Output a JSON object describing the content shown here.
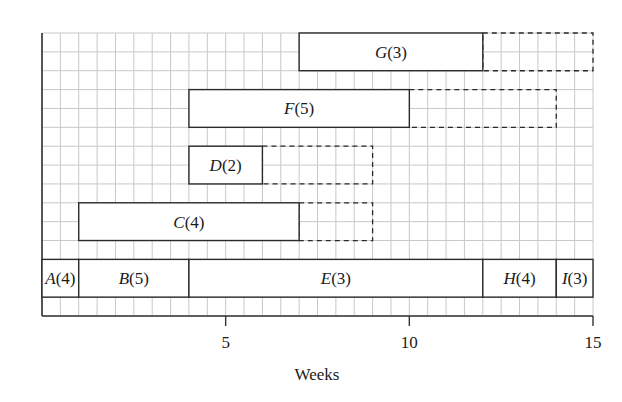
{
  "chart_data": {
    "type": "gantt",
    "title": "",
    "xlabel": "Weeks",
    "ylabel": "",
    "xlim": [
      0,
      15
    ],
    "x_ticks": [
      5,
      10,
      15
    ],
    "x_tick_labels": [
      "5",
      "10",
      "15"
    ],
    "grid": true,
    "grid_minor_step": 0.5,
    "rows": 15,
    "legend": null,
    "activities": [
      {
        "name": "A",
        "duration": 4,
        "label": "A(4)",
        "start": 0,
        "end": 1,
        "float_end": null,
        "row": 12.0,
        "height_rows": 2
      },
      {
        "name": "B",
        "duration": 5,
        "label": "B(5)",
        "start": 1,
        "end": 4,
        "float_end": null,
        "row": 12.0,
        "height_rows": 2
      },
      {
        "name": "E",
        "duration": 3,
        "label": "E(3)",
        "start": 4,
        "end": 12,
        "float_end": null,
        "row": 12.0,
        "height_rows": 2
      },
      {
        "name": "H",
        "duration": 4,
        "label": "H(4)",
        "start": 12,
        "end": 14,
        "float_end": null,
        "row": 12.0,
        "height_rows": 2
      },
      {
        "name": "I",
        "duration": 3,
        "label": "I(3)",
        "start": 14,
        "end": 15,
        "float_end": null,
        "row": 12.0,
        "height_rows": 2
      },
      {
        "name": "C",
        "duration": 4,
        "label": "C(4)",
        "start": 1,
        "end": 7,
        "float_end": 9,
        "row": 9.0,
        "height_rows": 2
      },
      {
        "name": "D",
        "duration": 2,
        "label": "D(2)",
        "start": 4,
        "end": 6,
        "float_end": 9,
        "row": 6.0,
        "height_rows": 2
      },
      {
        "name": "F",
        "duration": 5,
        "label": "F(5)",
        "start": 4,
        "end": 10,
        "float_end": 14,
        "row": 3.0,
        "height_rows": 2
      },
      {
        "name": "G",
        "duration": 3,
        "label": "G(3)",
        "start": 7,
        "end": 12,
        "float_end": 15,
        "row": 0.0,
        "height_rows": 2
      }
    ]
  },
  "colors": {
    "grid_minor": "#c8c8c8",
    "frame": "#333333",
    "bar_fill": "#ffffff",
    "bar_stroke": "#2a2a2a"
  }
}
